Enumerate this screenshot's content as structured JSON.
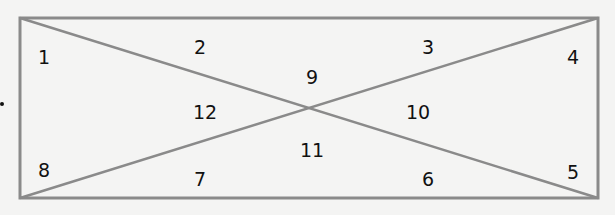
{
  "diagram": {
    "type": "rectangle-divided-by-diagonals",
    "stroke_color": "#8a8a8a",
    "background_color": "#f4f4f3",
    "label_color": "#111111",
    "rectangle": {
      "x1": 20,
      "y1": 18,
      "x2": 598,
      "y2": 198
    },
    "regions": [
      {
        "id": 1,
        "label": "1",
        "x": 44,
        "y": 57
      },
      {
        "id": 2,
        "label": "2",
        "x": 200,
        "y": 47
      },
      {
        "id": 3,
        "label": "3",
        "x": 428,
        "y": 47
      },
      {
        "id": 4,
        "label": "4",
        "x": 573,
        "y": 57
      },
      {
        "id": 5,
        "label": "5",
        "x": 573,
        "y": 172
      },
      {
        "id": 6,
        "label": "6",
        "x": 428,
        "y": 179
      },
      {
        "id": 7,
        "label": "7",
        "x": 200,
        "y": 179
      },
      {
        "id": 8,
        "label": "8",
        "x": 44,
        "y": 170
      },
      {
        "id": 9,
        "label": "9",
        "x": 312,
        "y": 77
      },
      {
        "id": 10,
        "label": "10",
        "x": 418,
        "y": 112
      },
      {
        "id": 11,
        "label": "11",
        "x": 312,
        "y": 150
      },
      {
        "id": 12,
        "label": "12",
        "x": 205,
        "y": 112
      }
    ]
  }
}
